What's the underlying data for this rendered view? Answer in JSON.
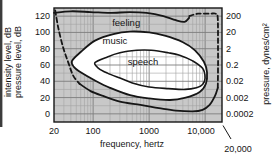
{
  "figure": {
    "colors": {
      "plot_background": "#c8c8c8",
      "grid_minor": "#a2a2a2",
      "grid_major": "#7e7e7e",
      "curve": "#161616",
      "frame": "#161616",
      "region_fill": "#ffffff",
      "text": "#151515",
      "scan_edge_artifact": "#3c3c3c"
    }
  },
  "axes": {
    "x": {
      "label": "frequency, hertz",
      "scale": "log",
      "range_hz": [
        20,
        20000
      ],
      "ticks": [
        {
          "label": "20",
          "value": 20
        },
        {
          "label": "100",
          "value": 100
        },
        {
          "label": "1000",
          "value": 1000
        },
        {
          "label": "10,000",
          "value": 10000
        }
      ],
      "annotation": {
        "text": "20,000",
        "value": 20000
      }
    },
    "y_left": {
      "label_line1": "intensity level, dB",
      "label_line2": "pressure level, dB",
      "range_db": [
        -10,
        130
      ],
      "ticks": [
        {
          "label": "120",
          "value": 120
        },
        {
          "label": "100",
          "value": 100
        },
        {
          "label": "80",
          "value": 80
        },
        {
          "label": "60",
          "value": 60
        },
        {
          "label": "40",
          "value": 40
        },
        {
          "label": "20",
          "value": 20
        },
        {
          "label": "0",
          "value": 0
        }
      ]
    },
    "y_right": {
      "label": "pressure, dynes/cm²",
      "ticks": [
        {
          "label": "200",
          "db": 120
        },
        {
          "label": "20",
          "db": 100
        },
        {
          "label": "2",
          "db": 80
        },
        {
          "label": "0.2",
          "db": 60
        },
        {
          "label": "0.02",
          "db": 40
        },
        {
          "label": "0.002",
          "db": 20
        },
        {
          "label": "0.0002",
          "db": 0
        }
      ]
    }
  },
  "chart_data": {
    "type": "area",
    "title": "",
    "x_unit": "hertz",
    "y_unit": "dB",
    "xlim": [
      20,
      20000
    ],
    "ylim": [
      -10,
      130
    ],
    "grid": true,
    "region_labels": [
      {
        "text": "feeling",
        "f": 390,
        "db": 112
      },
      {
        "text": "music",
        "f": 245,
        "db": 89
      },
      {
        "text": "speech",
        "f": 780,
        "db": 64
      }
    ],
    "curves": [
      {
        "name": "threshold-of-feeling",
        "style": "solid",
        "points": [
          [
            20,
            124
          ],
          [
            40,
            126
          ],
          [
            90,
            125
          ],
          [
            200,
            124
          ],
          [
            450,
            125
          ],
          [
            900,
            124
          ],
          [
            1800,
            120
          ],
          [
            3000,
            115
          ],
          [
            4300,
            113
          ],
          [
            5200,
            118
          ]
        ]
      },
      {
        "name": "upper-right-boundary",
        "style": "dashed",
        "points": [
          [
            5200,
            120
          ],
          [
            7500,
            123
          ],
          [
            12000,
            123
          ],
          [
            15500,
            123
          ],
          [
            16800,
            117
          ],
          [
            17000,
            80
          ],
          [
            17000,
            55
          ],
          [
            16800,
            32
          ]
        ]
      },
      {
        "name": "threshold-of-audibility-low-frequency",
        "style": "dashed",
        "points": [
          [
            21,
            127
          ],
          [
            24,
            105
          ],
          [
            29,
            82
          ],
          [
            36,
            63
          ],
          [
            44,
            47
          ],
          [
            57,
            37
          ]
        ]
      },
      {
        "name": "threshold-of-audibility",
        "style": "solid",
        "points": [
          [
            57,
            37
          ],
          [
            90,
            28
          ],
          [
            150,
            22
          ],
          [
            300,
            15
          ],
          [
            700,
            11
          ],
          [
            1500,
            7
          ],
          [
            3000,
            4
          ],
          [
            6000,
            3
          ],
          [
            9000,
            5
          ],
          [
            12000,
            11
          ],
          [
            15000,
            22
          ],
          [
            16800,
            32
          ]
        ]
      }
    ],
    "regions": [
      {
        "name": "music-region",
        "closed": true,
        "fill": "white",
        "points": [
          [
            42,
            65
          ],
          [
            60,
            76
          ],
          [
            108,
            90
          ],
          [
            230,
            98
          ],
          [
            455,
            101
          ],
          [
            1000,
            100
          ],
          [
            1900,
            96
          ],
          [
            4000,
            88
          ],
          [
            6600,
            78
          ],
          [
            9500,
            64
          ],
          [
            10800,
            51
          ],
          [
            10300,
            37
          ],
          [
            8000,
            27
          ],
          [
            4500,
            20
          ],
          [
            2350,
            17
          ],
          [
            1000,
            19
          ],
          [
            455,
            23
          ],
          [
            200,
            32
          ],
          [
            108,
            41
          ],
          [
            60,
            51
          ],
          [
            45,
            58
          ]
        ]
      },
      {
        "name": "speech-region",
        "closed": true,
        "fill": "grid-hatched",
        "points": [
          [
            108,
            63
          ],
          [
            180,
            70
          ],
          [
            300,
            75
          ],
          [
            600,
            78
          ],
          [
            1100,
            78
          ],
          [
            2200,
            75
          ],
          [
            3500,
            72
          ],
          [
            6000,
            65
          ],
          [
            9000,
            56
          ],
          [
            10000,
            44
          ],
          [
            9000,
            36
          ],
          [
            7000,
            32
          ],
          [
            4400,
            30
          ],
          [
            2200,
            31
          ],
          [
            1000,
            33
          ],
          [
            500,
            38
          ],
          [
            300,
            44
          ],
          [
            180,
            50
          ],
          [
            125,
            56
          ]
        ]
      }
    ]
  }
}
